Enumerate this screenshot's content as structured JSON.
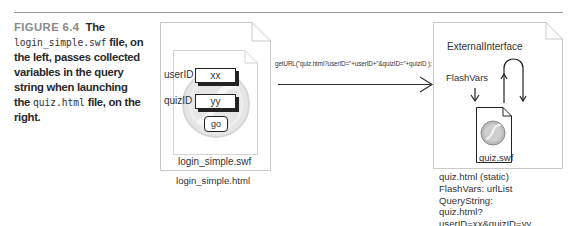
{
  "caption": {
    "figure_label": "FIGURE 6.4",
    "text_1": "The",
    "code_1": "login_simple.swf",
    "text_2": "file, on the left, passes collected variables in the query string when launching the",
    "code_2": "quiz.html",
    "text_3": "file, on the right."
  },
  "left_file": {
    "html_label": "login_simple.html",
    "swf_label": "login_simple.swf",
    "fields": [
      {
        "label": "userID",
        "value": "xx"
      },
      {
        "label": "quizID",
        "value": "yy"
      }
    ],
    "button_label": "go"
  },
  "arrow": {
    "code": "getURL(\"quiz.html?userID=\"+userID+\"&quizID=\"+quizID );"
  },
  "right_file": {
    "external_interface": "ExternalInterface",
    "flashvars": "FlashVars",
    "swf_label": "quiz.swf",
    "notes": [
      "quiz.html (static)",
      "FlashVars: urlList",
      "QueryString:",
      "quiz.html?userID=xx&quizID=yy"
    ]
  },
  "colors": {
    "rule": "#9a9a9a",
    "figure_label": "#8a8a8a",
    "file_border": "#c8c8c8",
    "ink": "#222222"
  }
}
